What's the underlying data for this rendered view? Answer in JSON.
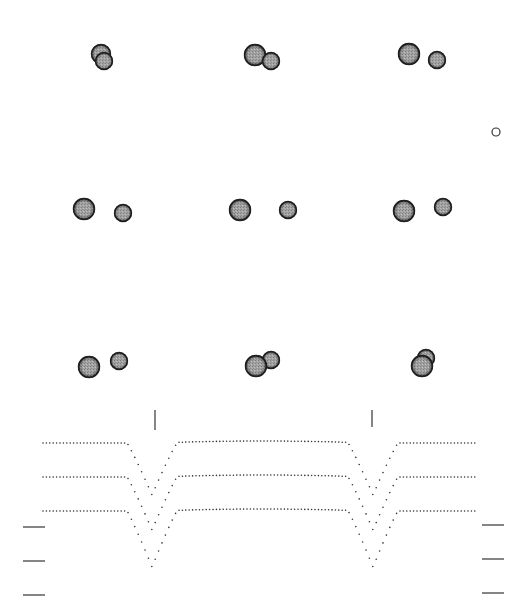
{
  "figure": {
    "type": "eclipsing-binary-diagram",
    "colors": {
      "star_fill": "#9a9a9a",
      "star_edge": "#1e1e1e",
      "curve": "#333333",
      "tick": "#333333"
    }
  },
  "frames": [
    {
      "id": 1,
      "big": {
        "cx": 101,
        "cy": 54,
        "r": 10
      },
      "small": {
        "cx": 104,
        "cy": 61,
        "r": 9
      },
      "front": "small"
    },
    {
      "id": 2,
      "big": {
        "cx": 255,
        "cy": 55,
        "r": 11
      },
      "small": {
        "cx": 271,
        "cy": 61,
        "r": 9
      },
      "front": "small"
    },
    {
      "id": 3,
      "big": {
        "cx": 409,
        "cy": 54,
        "r": 11
      },
      "small": {
        "cx": 437,
        "cy": 60,
        "r": 9
      },
      "front": "small"
    },
    {
      "id": 4,
      "big": {
        "cx": 84,
        "cy": 209,
        "r": 11
      },
      "small": {
        "cx": 123,
        "cy": 213,
        "r": 9
      },
      "front": "small"
    },
    {
      "id": 5,
      "big": {
        "cx": 240,
        "cy": 210,
        "r": 11
      },
      "small": {
        "cx": 288,
        "cy": 210,
        "r": 9
      },
      "front": "small"
    },
    {
      "id": 6,
      "big": {
        "cx": 404,
        "cy": 211,
        "r": 11
      },
      "small": {
        "cx": 443,
        "cy": 207,
        "r": 9
      },
      "front": "small"
    },
    {
      "id": 7,
      "big": {
        "cx": 89,
        "cy": 367,
        "r": 11
      },
      "small": {
        "cx": 119,
        "cy": 361,
        "r": 9
      },
      "front": "big"
    },
    {
      "id": 8,
      "big": {
        "cx": 256,
        "cy": 366,
        "r": 11
      },
      "small": {
        "cx": 271,
        "cy": 360,
        "r": 9
      },
      "front": "big"
    },
    {
      "id": 9,
      "big": {
        "cx": 422,
        "cy": 366,
        "r": 11
      },
      "small": {
        "cx": 426,
        "cy": 358,
        "r": 9
      },
      "front": "big"
    }
  ],
  "small_marker": {
    "cx": 496,
    "cy": 132,
    "r": 4
  },
  "chart_data": {
    "type": "scatter",
    "title": "",
    "xlabel": "",
    "ylabel": "",
    "grid": false,
    "legend": "none",
    "x_range_px": [
      43,
      478
    ],
    "eclipse_markers_x": [
      155,
      372
    ],
    "series": [
      {
        "name": "curve-1",
        "baseline_y": 443,
        "dip_min_y": 495
      },
      {
        "name": "curve-2",
        "baseline_y": 477,
        "dip_min_y": 530
      },
      {
        "name": "curve-3",
        "baseline_y": 511,
        "dip_min_y": 567
      }
    ],
    "dips": [
      {
        "center_x": 152,
        "half_width": 25
      },
      {
        "center_x": 373,
        "half_width": 25
      }
    ]
  },
  "ticks": {
    "left": [
      {
        "y": 527,
        "x1": 23,
        "x2": 45
      },
      {
        "y": 561,
        "x1": 23,
        "x2": 45
      },
      {
        "y": 595,
        "x1": 23,
        "x2": 45
      }
    ],
    "right": [
      {
        "y": 525,
        "x1": 482,
        "x2": 504
      },
      {
        "y": 559,
        "x1": 482,
        "x2": 504
      },
      {
        "y": 593,
        "x1": 482,
        "x2": 504
      }
    ],
    "vertical": [
      {
        "x": 155,
        "y1": 410,
        "y2": 430
      },
      {
        "x": 372,
        "y1": 410,
        "y2": 427
      }
    ]
  }
}
